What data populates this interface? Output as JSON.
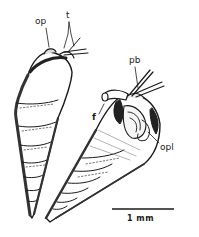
{
  "figure": {
    "views": [
      {
        "name": "dorsal-view",
        "position": "left"
      },
      {
        "name": "ventral-view",
        "position": "right"
      }
    ],
    "labels": {
      "op": "op",
      "t": "t",
      "pb": "pb",
      "f": "f",
      "opl": "opl"
    },
    "scale_bar": {
      "label": "1 mm"
    },
    "colors": {
      "ink": "#1a1a1a",
      "background": "#ffffff",
      "shading": "#6b6b6b"
    }
  }
}
